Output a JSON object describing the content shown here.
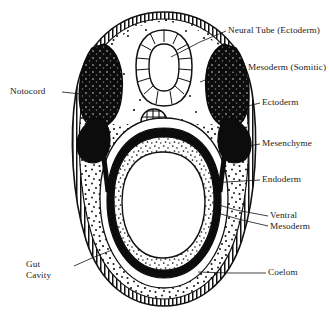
{
  "figure": {
    "background_color": "#ffffff",
    "ink_color": "#111111"
  },
  "labels": [
    {
      "key": "neural_tube",
      "text": "Neural Tube (Ectoderm)",
      "x": 228,
      "y": 27,
      "lines": 1
    },
    {
      "key": "mesoderm_somitic",
      "text": "Mesoderm (Somitic)",
      "x": 248,
      "y": 64,
      "lines": 1
    },
    {
      "key": "ectoderm",
      "text": "Ectoderm",
      "x": 262,
      "y": 99,
      "lines": 1
    },
    {
      "key": "mesenchyme",
      "text": "Mesenchyme",
      "x": 262,
      "y": 140,
      "lines": 1
    },
    {
      "key": "endoderm",
      "text": "Endoderm",
      "x": 262,
      "y": 176,
      "lines": 1
    },
    {
      "key": "ventral_mesoderm",
      "text": "Ventral\nMesoderm",
      "x": 270,
      "y": 215,
      "lines": 2
    },
    {
      "key": "coelom",
      "text": "Coelom",
      "x": 268,
      "y": 270,
      "lines": 1
    },
    {
      "key": "notocord",
      "text": "Notocord",
      "x": 10,
      "y": 91,
      "lines": 1
    },
    {
      "key": "gut_cavity",
      "text": "Gut\nCavity",
      "x": 24,
      "y": 264,
      "lines": 2
    }
  ],
  "label_texts": {
    "neural_tube": "Neural Tube (Ectoderm)",
    "mesoderm_somitic": "Mesoderm (Somitic)",
    "ectoderm": "Ectoderm",
    "mesenchyme": "Mesenchyme",
    "endoderm": "Endoderm",
    "ventral_mesoderm_line1": "Ventral",
    "ventral_mesoderm_line2": "Mesoderm",
    "coelom": "Coelom",
    "notocord": "Notocord",
    "gut_cavity_line1": "Gut",
    "gut_cavity_line2": "Cavity"
  },
  "structures": [
    {
      "name": "neural-tube",
      "description": "Oval dorsal tube with radial columnar cells and central lumen"
    },
    {
      "name": "somite-left",
      "description": "Dark wedge-shaped somitic mesoderm, left of neural tube"
    },
    {
      "name": "somite-right",
      "description": "Dark wedge-shaped somitic mesoderm, right of neural tube"
    },
    {
      "name": "notochord",
      "description": "Small stippled circle beneath the neural tube"
    },
    {
      "name": "ectoderm-layer",
      "description": "Outer hatched epidermal boundary of the embryo"
    },
    {
      "name": "mesenchyme-layer",
      "description": "Stippled loose tissue between ectoderm and coelom"
    },
    {
      "name": "ventral-mesoderm",
      "description": "Dark band surrounding the gut"
    },
    {
      "name": "endoderm-layer",
      "description": "Stippled ring lining the gut cavity"
    },
    {
      "name": "coelom-space",
      "description": "White body cavity between mesoderm layers"
    },
    {
      "name": "gut-cavity",
      "description": "Large central white archenteron lumen"
    }
  ],
  "leader_lines": [
    {
      "from": "neural_tube",
      "to_x": 168,
      "to_y": 58
    },
    {
      "from": "mesoderm_somitic",
      "to_x": 196,
      "to_y": 82
    },
    {
      "from": "ectoderm",
      "to_x": 233,
      "to_y": 110
    },
    {
      "from": "mesenchyme",
      "to_x": 227,
      "to_y": 150
    },
    {
      "from": "endoderm",
      "to_x": 215,
      "to_y": 182
    },
    {
      "from": "ventral_mesoderm",
      "to_x": 205,
      "to_y": 208
    },
    {
      "from": "coelom",
      "to_x": 196,
      "to_y": 272
    },
    {
      "from": "notocord",
      "to_x": 110,
      "to_y": 100
    },
    {
      "from": "gut_cavity",
      "to_x": 110,
      "to_y": 252
    }
  ]
}
